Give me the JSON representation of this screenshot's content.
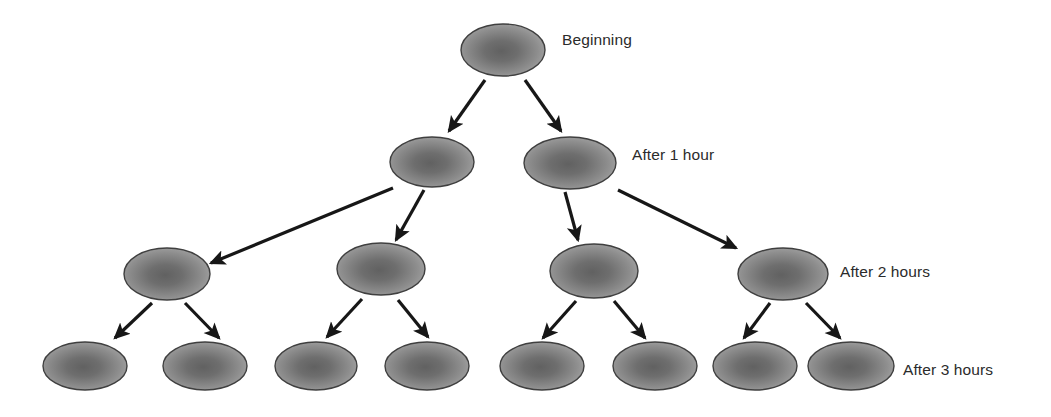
{
  "diagram": {
    "type": "binary-tree",
    "background_color": "#ffffff",
    "node_shape": "ellipse",
    "node_fill_center": "#6e6e6e",
    "node_fill_edge": "#a5a5a5",
    "node_stroke": "#3f3f3f",
    "arrow_color": "#171717",
    "label_color": "#2b2b2b",
    "levels": [
      {
        "id": "level-0",
        "label": "Beginning",
        "cell_count": 1,
        "label_position": {
          "x": 562,
          "y": 32
        },
        "nodes": [
          {
            "cx": 503,
            "cy": 50,
            "rx": 42,
            "ry": 26
          }
        ]
      },
      {
        "id": "level-1",
        "label": "After 1 hour",
        "cell_count": 2,
        "label_position": {
          "x": 632,
          "y": 147
        },
        "nodes": [
          {
            "cx": 432,
            "cy": 162,
            "rx": 42,
            "ry": 25
          },
          {
            "cx": 570,
            "cy": 163,
            "rx": 46,
            "ry": 26
          }
        ]
      },
      {
        "id": "level-2",
        "label": "After 2 hours",
        "cell_count": 4,
        "label_position": {
          "x": 840,
          "y": 264
        },
        "nodes": [
          {
            "cx": 167,
            "cy": 274,
            "rx": 43,
            "ry": 26
          },
          {
            "cx": 381,
            "cy": 269,
            "rx": 44,
            "ry": 26
          },
          {
            "cx": 594,
            "cy": 271,
            "rx": 44,
            "ry": 27
          },
          {
            "cx": 783,
            "cy": 274,
            "rx": 45,
            "ry": 26
          }
        ]
      },
      {
        "id": "level-3",
        "label": "After 3 hours",
        "cell_count": 8,
        "label_position": {
          "x": 903,
          "y": 362
        },
        "nodes": [
          {
            "cx": 85,
            "cy": 366,
            "rx": 42,
            "ry": 24
          },
          {
            "cx": 205,
            "cy": 366,
            "rx": 42,
            "ry": 24
          },
          {
            "cx": 316,
            "cy": 366,
            "rx": 41,
            "ry": 24
          },
          {
            "cx": 427,
            "cy": 366,
            "rx": 42,
            "ry": 24
          },
          {
            "cx": 542,
            "cy": 366,
            "rx": 42,
            "ry": 24
          },
          {
            "cx": 655,
            "cy": 366,
            "rx": 42,
            "ry": 24
          },
          {
            "cx": 755,
            "cy": 366,
            "rx": 42,
            "ry": 24
          },
          {
            "cx": 851,
            "cy": 366,
            "rx": 43,
            "ry": 24
          }
        ]
      }
    ],
    "arrows": [
      {
        "id": "arrow-root-to-l1-left",
        "from": [
          485,
          80
        ],
        "to": [
          449,
          131
        ]
      },
      {
        "id": "arrow-root-to-l1-right",
        "from": [
          525,
          80
        ],
        "to": [
          561,
          131
        ]
      },
      {
        "id": "arrow-l1a-to-l2a",
        "from": [
          393,
          188
        ],
        "to": [
          211,
          263
        ]
      },
      {
        "id": "arrow-l1a-to-l2b",
        "from": [
          424,
          190
        ],
        "to": [
          396,
          240
        ]
      },
      {
        "id": "arrow-l1b-to-l2c",
        "from": [
          565,
          192
        ],
        "to": [
          578,
          240
        ]
      },
      {
        "id": "arrow-l1b-to-l2d",
        "from": [
          618,
          190
        ],
        "to": [
          736,
          248
        ]
      },
      {
        "id": "arrow-l2a-to-l3a",
        "from": [
          152,
          303
        ],
        "to": [
          115,
          338
        ]
      },
      {
        "id": "arrow-l2a-to-l3b",
        "from": [
          185,
          303
        ],
        "to": [
          219,
          338
        ]
      },
      {
        "id": "arrow-l2b-to-l3c",
        "from": [
          362,
          299
        ],
        "to": [
          327,
          337
        ]
      },
      {
        "id": "arrow-l2b-to-l3d",
        "from": [
          398,
          300
        ],
        "to": [
          428,
          337
        ]
      },
      {
        "id": "arrow-l2c-to-l3e",
        "from": [
          576,
          301
        ],
        "to": [
          543,
          338
        ]
      },
      {
        "id": "arrow-l2c-to-l3f",
        "from": [
          614,
          301
        ],
        "to": [
          645,
          338
        ]
      },
      {
        "id": "arrow-l2d-to-l3g",
        "from": [
          770,
          303
        ],
        "to": [
          744,
          338
        ]
      },
      {
        "id": "arrow-l2d-to-l3h",
        "from": [
          806,
          303
        ],
        "to": [
          840,
          338
        ]
      }
    ]
  }
}
